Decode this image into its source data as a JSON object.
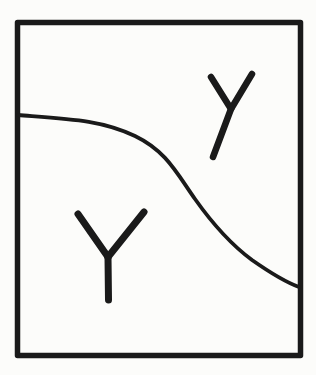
{
  "canvas": {
    "width": 316,
    "height": 375,
    "background": "#fcfcfa",
    "ink_color": "#1a1a1a"
  },
  "frame": {
    "x": 17.5,
    "y": 22.5,
    "width": 283,
    "height": 333,
    "stroke_width": 5.5
  },
  "divider_curve": {
    "path": "M 18 115 C 70 119 102 120 135 136 C 166 151 176 172 195 199 C 212 223 229 243 252 260 C 272 274 288 283 299 287",
    "stroke_width": 3.8
  },
  "symbols": [
    {
      "label": "Y",
      "name": "y-symbol-upper-right",
      "region": "above-curve",
      "stroke_width": 6.5,
      "strokes": [
        "M 211 77 L 231 109",
        "M 252 74 L 231 109 L 213 157"
      ]
    },
    {
      "label": "Y",
      "name": "y-symbol-lower-left",
      "region": "below-curve",
      "stroke_width": 7,
      "strokes": [
        "M 78 214 L 108 257",
        "M 144 212 L 108 257",
        "M 108 257 L 108.5 300"
      ]
    }
  ]
}
